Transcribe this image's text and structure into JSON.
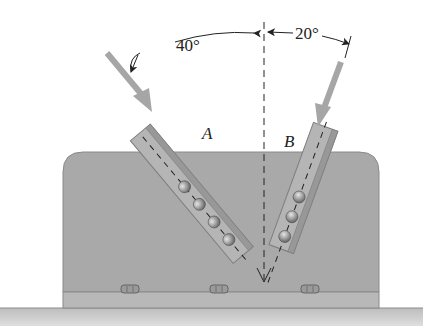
{
  "figure": {
    "type": "engineering statics diagram"
  },
  "angles": {
    "left": "40°",
    "right": "20°"
  },
  "members": [
    {
      "label": "A",
      "bolts": 4,
      "angle_from_vertical_deg": 40,
      "side": "left"
    },
    {
      "label": "B",
      "bolts": 3,
      "angle_from_vertical_deg": 20,
      "side": "right"
    }
  ],
  "base_bolts": 3,
  "colors": {
    "plate": "#a9a9a9",
    "plate_edge": "#8a8a8a",
    "base": "#b8b8b8",
    "ground": "#cfcfcf",
    "member": "#b5b5b5",
    "member_edge": "#7d7d7d",
    "force_arrow": "#a6a6a6",
    "bolt": "#9a9a9a",
    "line": "#222222"
  }
}
